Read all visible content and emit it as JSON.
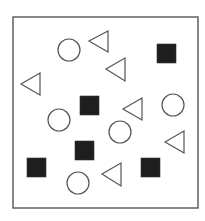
{
  "figure": {
    "width": 205,
    "height": 221,
    "background": "#ffffff",
    "frame": {
      "x": 13,
      "y": 17,
      "width": 185,
      "height": 191,
      "stroke": "#555555",
      "stroke_width": 1.4
    },
    "colors": {
      "outline": "#555555",
      "fill_dark": "#1e1e1e"
    },
    "shapes": [
      {
        "type": "circle",
        "cx": 69,
        "cy": 50,
        "r": 11
      },
      {
        "type": "triangle-left",
        "tip_x": 89,
        "tip_y": 41,
        "right_x": 108,
        "top_y": 31,
        "bottom_y": 52
      },
      {
        "type": "square",
        "x": 157,
        "y": 44,
        "size": 19
      },
      {
        "type": "triangle-left",
        "tip_x": 106,
        "tip_y": 69,
        "right_x": 125,
        "top_y": 58,
        "bottom_y": 81
      },
      {
        "type": "triangle-left",
        "tip_x": 21,
        "tip_y": 84,
        "right_x": 40,
        "top_y": 73,
        "bottom_y": 95
      },
      {
        "type": "square",
        "x": 80,
        "y": 96,
        "size": 19
      },
      {
        "type": "triangle-left",
        "tip_x": 123,
        "tip_y": 109,
        "right_x": 142,
        "top_y": 98,
        "bottom_y": 120
      },
      {
        "type": "circle",
        "cx": 173,
        "cy": 105,
        "r": 11
      },
      {
        "type": "circle",
        "cx": 59,
        "cy": 120,
        "r": 11
      },
      {
        "type": "circle",
        "cx": 120,
        "cy": 132,
        "r": 11
      },
      {
        "type": "triangle-left",
        "tip_x": 165,
        "tip_y": 142,
        "right_x": 184,
        "top_y": 131,
        "bottom_y": 153
      },
      {
        "type": "square",
        "x": 75,
        "y": 141,
        "size": 19
      },
      {
        "type": "square",
        "x": 27,
        "y": 158,
        "size": 19
      },
      {
        "type": "triangle-left",
        "tip_x": 102,
        "tip_y": 174,
        "right_x": 121,
        "top_y": 163,
        "bottom_y": 186
      },
      {
        "type": "square",
        "x": 141,
        "y": 158,
        "size": 19
      },
      {
        "type": "circle",
        "cx": 78,
        "cy": 183,
        "r": 11
      }
    ],
    "counts": {
      "circles": 5,
      "triangles": 6,
      "squares": 5
    }
  }
}
